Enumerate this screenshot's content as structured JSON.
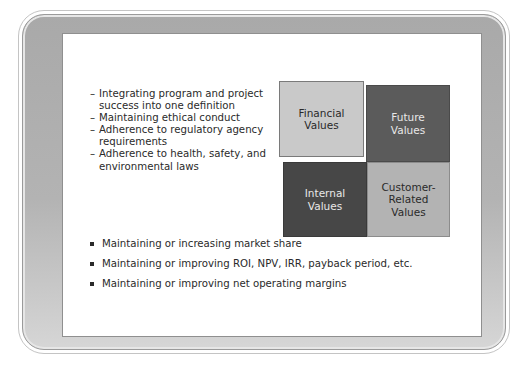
{
  "slide": {
    "dash_items": [
      "Integrating program and project success into one definition",
      "Maintaining ethical conduct",
      "Adherence to regulatory agency requirements",
      "Adherence to health, safety, and environmental laws"
    ],
    "quadrants": {
      "financial": "Financial Values",
      "future": "Future Values",
      "internal": "Internal Values",
      "customer": "Customer-Related Values"
    },
    "bullet_items": [
      "Maintaining or increasing market share",
      "Maintaining or improving ROI, NPV, IRR, payback period, etc.",
      "Maintaining or improving net operating margins"
    ],
    "colors": {
      "financial": "#c9c9c9",
      "future": "#5b5b5b",
      "internal": "#474747",
      "customer": "#b3b3b3"
    }
  }
}
